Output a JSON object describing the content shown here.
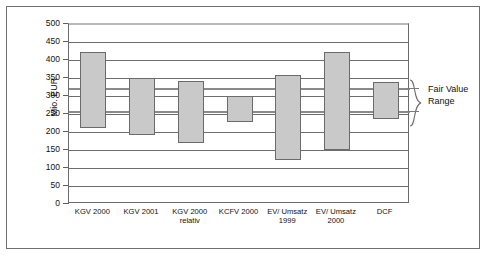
{
  "chart_data": {
    "type": "bar",
    "subtype": "floating-range-bar",
    "title": "",
    "xlabel": "",
    "ylabel": "Mio. EUR",
    "ylim": [
      0,
      500
    ],
    "ytick_step": 50,
    "yticks": [
      "500",
      "450",
      "400",
      "350",
      "300",
      "250",
      "200",
      "150",
      "100",
      "50",
      "0"
    ],
    "grid": true,
    "legend": "none",
    "categories": [
      "KGV 2000",
      "KGV 2001",
      "KGV 2000\nrelativ",
      "KCFV 2000",
      "EV/ Umsatz\n1999",
      "EV/ Umsatz\n2000",
      "DCF"
    ],
    "series": [
      {
        "name": "low",
        "values": [
          210,
          192,
          169,
          227,
          123,
          149,
          235
        ]
      },
      {
        "name": "high",
        "values": [
          423,
          349,
          341,
          299,
          358,
          423,
          338
        ]
      }
    ],
    "ranges": [
      {
        "category": "KGV 2000",
        "low": 210,
        "high": 423
      },
      {
        "category": "KGV 2001",
        "low": 192,
        "high": 349
      },
      {
        "category": "KGV 2000 relativ",
        "low": 169,
        "high": 341
      },
      {
        "category": "KCFV 2000",
        "low": 227,
        "high": 299
      },
      {
        "category": "EV/ Umsatz 1999",
        "low": 123,
        "high": 358
      },
      {
        "category": "EV/ Umsatz 2000",
        "low": 149,
        "high": 423
      },
      {
        "category": "DCF",
        "low": 235,
        "high": 338
      }
    ],
    "annotations": [
      {
        "label": "Fair Value\nRange",
        "band_low": 255,
        "band_high": 320
      }
    ],
    "colors": {
      "bar_fill": "#c9c9c9",
      "bar_stroke": "#6b6b6b",
      "gridline": "#6d6d6d",
      "band_edge": "#8a8a8a",
      "frame": "#6f6f6f",
      "text": "#111111",
      "background": "#ffffff"
    }
  }
}
